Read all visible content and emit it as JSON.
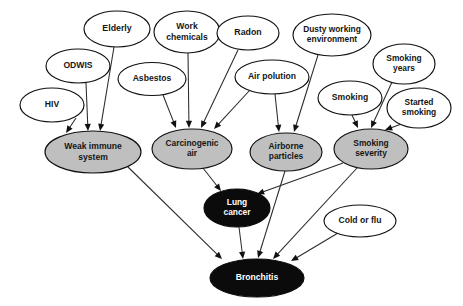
{
  "diagram": {
    "type": "directed-acyclic-graph",
    "canvas": {
      "width": 463,
      "height": 306,
      "background": "#ffffff"
    },
    "styles": {
      "root_fill": "#ffffff",
      "intermediate_fill": "#bfbfbf",
      "target_fill": "#0b0b0b",
      "stroke": "#111111",
      "edge_color": "#2a2a2a",
      "label_dark": "#161616",
      "label_light": "#ffffff"
    },
    "nodes": [
      {
        "id": "hiv",
        "label": "HIV",
        "lines": [
          "HIV"
        ],
        "cx": 52,
        "cy": 105,
        "rx": 32,
        "ry": 17,
        "kind": "root",
        "font": 8.6
      },
      {
        "id": "odwis",
        "label": "ODWIS",
        "lines": [
          "ODWIS"
        ],
        "cx": 78,
        "cy": 66,
        "rx": 32,
        "ry": 17,
        "kind": "root",
        "font": 8.6
      },
      {
        "id": "elderly",
        "label": "Elderly",
        "lines": [
          "Elderly"
        ],
        "cx": 117,
        "cy": 29,
        "rx": 33,
        "ry": 18,
        "kind": "root",
        "font": 8.8
      },
      {
        "id": "asbestos",
        "label": "Asbestos",
        "lines": [
          "Asbestos"
        ],
        "cx": 152,
        "cy": 79,
        "rx": 34,
        "ry": 16.5,
        "kind": "root",
        "font": 8.6
      },
      {
        "id": "workchem",
        "label": "Work chemicals",
        "lines": [
          "Work",
          "chemicals"
        ],
        "cx": 187,
        "cy": 32,
        "rx": 33,
        "ry": 21,
        "kind": "root",
        "font": 8.6
      },
      {
        "id": "radon",
        "label": "Radon",
        "lines": [
          "Radon"
        ],
        "cx": 248,
        "cy": 33,
        "rx": 31,
        "ry": 17,
        "kind": "root",
        "font": 8.8
      },
      {
        "id": "airpol",
        "label": "Air polution",
        "lines": [
          "Air polution"
        ],
        "cx": 272,
        "cy": 77,
        "rx": 37,
        "ry": 17,
        "kind": "root",
        "font": 8.6
      },
      {
        "id": "dusty",
        "label": "Dusty working environment",
        "lines": [
          "Dusty working",
          "environment"
        ],
        "cx": 332,
        "cy": 35,
        "rx": 39,
        "ry": 21,
        "kind": "root",
        "font": 8.4
      },
      {
        "id": "smokyears",
        "label": "Smoking years",
        "lines": [
          "Smoking",
          "years"
        ],
        "cx": 404,
        "cy": 64,
        "rx": 31,
        "ry": 20,
        "kind": "root",
        "font": 8.4
      },
      {
        "id": "smoking",
        "label": "Smoking",
        "lines": [
          "Smoking"
        ],
        "cx": 350,
        "cy": 98,
        "rx": 32,
        "ry": 17,
        "kind": "root",
        "font": 8.6
      },
      {
        "id": "started",
        "label": "Started smoking",
        "lines": [
          "Started",
          "smoking"
        ],
        "cx": 419,
        "cy": 108,
        "rx": 32,
        "ry": 20,
        "kind": "root",
        "font": 8.4
      },
      {
        "id": "coldflu",
        "label": "Cold or flu",
        "lines": [
          "Cold or flu"
        ],
        "cx": 360,
        "cy": 221,
        "rx": 36,
        "ry": 16,
        "kind": "root",
        "font": 8.6
      },
      {
        "id": "weak",
        "label": "Weak immune system",
        "lines": [
          "Weak immune",
          "system"
        ],
        "cx": 93,
        "cy": 152,
        "rx": 48,
        "ry": 21,
        "kind": "mid",
        "font": 8.6
      },
      {
        "id": "carcair",
        "label": "Carcinogenic air",
        "lines": [
          "Carcinogenic",
          "air"
        ],
        "cx": 192,
        "cy": 149,
        "rx": 40,
        "ry": 20,
        "kind": "mid",
        "font": 8.4
      },
      {
        "id": "airborne",
        "label": "Airborne particles",
        "lines": [
          "Airborne",
          "particles"
        ],
        "cx": 286,
        "cy": 152,
        "rx": 36,
        "ry": 19,
        "kind": "mid",
        "font": 8.4
      },
      {
        "id": "smoksev",
        "label": "Smoking severity",
        "lines": [
          "Smoking",
          "severity"
        ],
        "cx": 371,
        "cy": 149,
        "rx": 37,
        "ry": 20,
        "kind": "mid",
        "font": 8.4
      },
      {
        "id": "lung",
        "label": "Lung cancer",
        "lines": [
          "Lung",
          "cancer"
        ],
        "cx": 237,
        "cy": 208,
        "rx": 33,
        "ry": 19,
        "kind": "target",
        "font": 8.4
      },
      {
        "id": "bronch",
        "label": "Bronchitis",
        "lines": [
          "Bronchitis"
        ],
        "cx": 257,
        "cy": 278,
        "rx": 47,
        "ry": 19,
        "kind": "target",
        "font": 8.6
      }
    ],
    "edges": [
      {
        "from": "hiv",
        "to": "weak",
        "x1": 76,
        "y1": 118,
        "x2": 66,
        "y2": 133
      },
      {
        "from": "odwis",
        "to": "weak",
        "x1": 86,
        "y1": 83,
        "x2": 88,
        "y2": 131
      },
      {
        "from": "elderly",
        "to": "weak",
        "x1": 114,
        "y1": 47,
        "x2": 100,
        "y2": 131
      },
      {
        "from": "asbestos",
        "to": "carcair",
        "x1": 163,
        "y1": 95,
        "x2": 176,
        "y2": 128
      },
      {
        "from": "workchem",
        "to": "carcair",
        "x1": 188,
        "y1": 53,
        "x2": 189,
        "y2": 128
      },
      {
        "from": "radon",
        "to": "carcair",
        "x1": 238,
        "y1": 50,
        "x2": 201,
        "y2": 128
      },
      {
        "from": "airpol",
        "to": "carcair",
        "x1": 250,
        "y1": 90,
        "x2": 214,
        "y2": 129
      },
      {
        "from": "airpol",
        "to": "airborne",
        "x1": 275,
        "y1": 94,
        "x2": 279,
        "y2": 132
      },
      {
        "from": "dusty",
        "to": "airborne",
        "x1": 318,
        "y1": 55,
        "x2": 294,
        "y2": 132
      },
      {
        "from": "smoking",
        "to": "smoksev",
        "x1": 352,
        "y1": 115,
        "x2": 358,
        "y2": 128
      },
      {
        "from": "smokyears",
        "to": "smoksev",
        "x1": 392,
        "y1": 82,
        "x2": 371,
        "y2": 128
      },
      {
        "from": "started",
        "to": "smoksev",
        "x1": 404,
        "y1": 123,
        "x2": 385,
        "y2": 130
      },
      {
        "from": "carcair",
        "to": "lung",
        "x1": 203,
        "y1": 168,
        "x2": 221,
        "y2": 191
      },
      {
        "from": "smoksev",
        "to": "lung",
        "x1": 343,
        "y1": 163,
        "x2": 257,
        "y2": 194
      },
      {
        "from": "weak",
        "to": "bronch",
        "x1": 128,
        "y1": 167,
        "x2": 222,
        "y2": 259
      },
      {
        "from": "lung",
        "to": "bronch",
        "x1": 239,
        "y1": 227,
        "x2": 243,
        "y2": 259
      },
      {
        "from": "airborne",
        "to": "bronch",
        "x1": 285,
        "y1": 171,
        "x2": 258,
        "y2": 258
      },
      {
        "from": "smoksev",
        "to": "bronch",
        "x1": 357,
        "y1": 168,
        "x2": 273,
        "y2": 259
      },
      {
        "from": "coldflu",
        "to": "bronch",
        "x1": 338,
        "y1": 233,
        "x2": 291,
        "y2": 261
      }
    ]
  }
}
